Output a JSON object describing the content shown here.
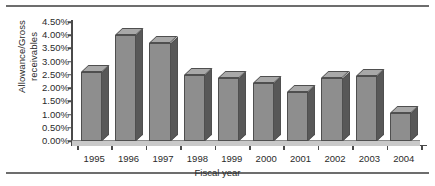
{
  "chart_data": {
    "type": "bar",
    "title": "",
    "subtitle": "",
    "xlabel": "Fiscal year",
    "ylabel": "Allowance/Gross receivables",
    "ylabel_lines": [
      "Allowance/Gross",
      "receivables"
    ],
    "categories": [
      "1995",
      "1996",
      "1997",
      "1998",
      "1999",
      "2000",
      "2001",
      "2002",
      "2003",
      "2004"
    ],
    "values": [
      2.6,
      4.0,
      3.7,
      2.5,
      2.4,
      2.2,
      1.85,
      2.4,
      2.45,
      1.05
    ],
    "value_labels": [
      "2.60%",
      "4.00%",
      "3.70%",
      "2.50%",
      "2.40%",
      "2.20%",
      "1.85%",
      "2.40%",
      "2.45%",
      "1.05%"
    ],
    "ylim": [
      0,
      4.5
    ],
    "ytick_values": [
      0.0,
      0.5,
      1.0,
      1.5,
      2.0,
      2.5,
      3.0,
      3.5,
      4.0,
      4.5
    ],
    "ytick_labels": [
      "0.00%",
      "0.50%",
      "1.00%",
      "1.50%",
      "2.00%",
      "2.50%",
      "3.00%",
      "3.50%",
      "4.00%",
      "4.50%"
    ],
    "grid": false,
    "legend": false,
    "legend_position": "none",
    "style": "3d-column",
    "unit": "percent"
  },
  "colors": {
    "bar_front": "#8e8e8e",
    "bar_top": "#a8a8a8",
    "bar_side": "#585858",
    "bar_outline": "#4f4f4f",
    "axis": "#4a4a4a",
    "rule": "#6d6d6d",
    "text": "#2b2b2b",
    "background": "#ffffff",
    "floor": "#c9c9c9"
  }
}
